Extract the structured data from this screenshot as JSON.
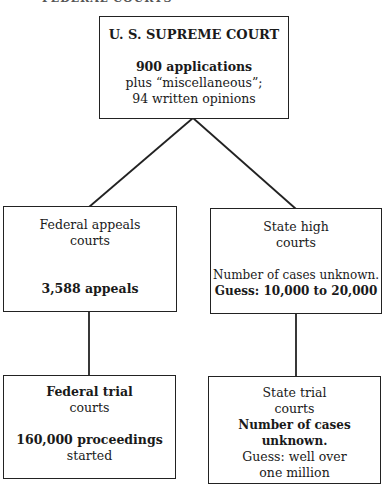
{
  "header_fragment": "FEDERAL COURTS",
  "nodes": {
    "supreme": {
      "title": "U. S. SUPREME COURT",
      "line1": "900 applications",
      "line2": "plus “miscellaneous”;",
      "line3": "94 written opinions"
    },
    "fed_appeals": {
      "title1": "Federal appeals",
      "title2": "courts",
      "detail": "3,588 appeals"
    },
    "state_high": {
      "title1": "State high",
      "title2": "courts",
      "detail1": "Number of cases unknown.",
      "detail2": "Guess: 10,000 to 20,000"
    },
    "fed_trial": {
      "title1": "Federal trial",
      "title2": "courts",
      "detail1": "160,000 proceedings",
      "detail2": "started"
    },
    "state_trial": {
      "title1": "State trial",
      "title2": "courts",
      "detail1": "Number of cases unknown.",
      "detail2": "Guess: well over",
      "detail3": "one million"
    }
  }
}
